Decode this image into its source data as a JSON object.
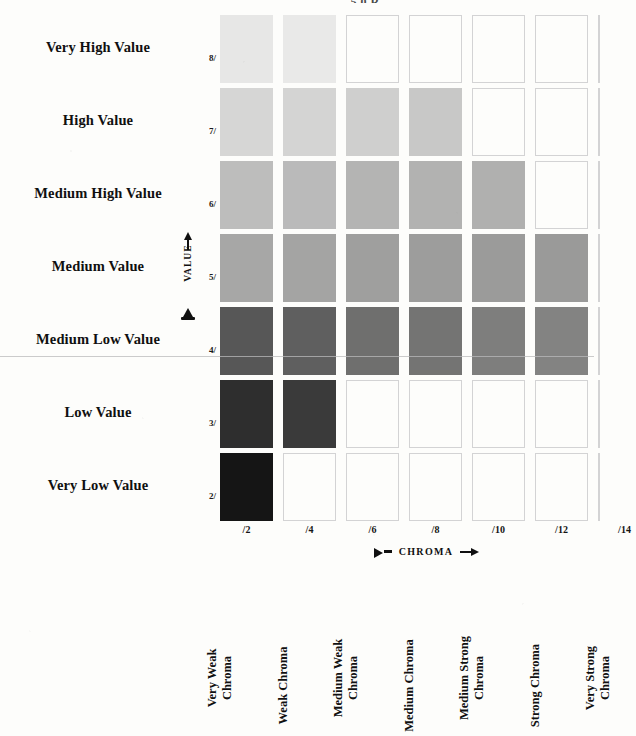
{
  "caption": {
    "top_partial": "5.0 R"
  },
  "axes": {
    "value_axis_label": "VALUE",
    "chroma_axis_label": "CHROMA",
    "value_ticks": [
      "8/",
      "7/",
      "6/",
      "5/",
      "4/",
      "3/",
      "2/"
    ],
    "chroma_ticks": [
      "/2",
      "/4",
      "/6",
      "/8",
      "/10",
      "/12",
      "/14"
    ]
  },
  "rows": [
    {
      "label": "Very High Value",
      "tick": "8/"
    },
    {
      "label": "High Value",
      "tick": "7/"
    },
    {
      "label": "Medium High Value",
      "tick": "6/"
    },
    {
      "label": "Medium Value",
      "tick": "5/"
    },
    {
      "label": "Medium Low Value",
      "tick": "4/"
    },
    {
      "label": "Low Value",
      "tick": "3/"
    },
    {
      "label": "Very Low Value",
      "tick": "2/"
    }
  ],
  "columns": [
    {
      "tick": "/2",
      "name": "Very Weak\nChroma"
    },
    {
      "tick": "/4",
      "name": "Weak Chroma"
    },
    {
      "tick": "/6",
      "name": "Medium Weak\nChroma"
    },
    {
      "tick": "/8",
      "name": "Medium Chroma"
    },
    {
      "tick": "/10",
      "name": "Medium Strong\nChroma"
    },
    {
      "tick": "/12",
      "name": "Strong Chroma"
    },
    {
      "tick": "/14",
      "name": "Very Strong\nChroma"
    }
  ],
  "chart_data": {
    "type": "heatmap",
    "xlabel": "CHROMA",
    "ylabel": "VALUE",
    "x": [
      "/2",
      "/4",
      "/6",
      "/8",
      "/10",
      "/12",
      "/14"
    ],
    "y": [
      "8/",
      "7/",
      "6/",
      "5/",
      "4/",
      "3/",
      "2/"
    ],
    "grid": false,
    "legend": "none",
    "note": "Grayscale reproduction of a Munsell hue page; cells present only where that value/chroma combination exists.",
    "cells": [
      {
        "value": "8/",
        "chroma": "/2",
        "filled": true,
        "color": "#e7e7e6"
      },
      {
        "value": "8/",
        "chroma": "/4",
        "filled": true,
        "color": "#e9e9e8"
      },
      {
        "value": "8/",
        "chroma": "/6",
        "filled": false,
        "color": "#fdfdfb"
      },
      {
        "value": "8/",
        "chroma": "/8",
        "filled": false,
        "color": "#fdfdfb"
      },
      {
        "value": "8/",
        "chroma": "/10",
        "filled": false,
        "color": "#fdfdfb"
      },
      {
        "value": "8/",
        "chroma": "/12",
        "filled": false,
        "color": "#fdfdfb"
      },
      {
        "value": "8/",
        "chroma": "/14",
        "filled": false,
        "color": "#fdfdfb"
      },
      {
        "value": "7/",
        "chroma": "/2",
        "filled": true,
        "color": "#d6d6d5"
      },
      {
        "value": "7/",
        "chroma": "/4",
        "filled": true,
        "color": "#d4d4d3"
      },
      {
        "value": "7/",
        "chroma": "/6",
        "filled": true,
        "color": "#cfcfce"
      },
      {
        "value": "7/",
        "chroma": "/8",
        "filled": true,
        "color": "#c8c8c7"
      },
      {
        "value": "7/",
        "chroma": "/10",
        "filled": false,
        "color": "#fdfdfb"
      },
      {
        "value": "7/",
        "chroma": "/12",
        "filled": false,
        "color": "#fdfdfb"
      },
      {
        "value": "7/",
        "chroma": "/14",
        "filled": false,
        "color": "#fdfdfb"
      },
      {
        "value": "6/",
        "chroma": "/2",
        "filled": true,
        "color": "#bdbdbc"
      },
      {
        "value": "6/",
        "chroma": "/4",
        "filled": true,
        "color": "#bababa"
      },
      {
        "value": "6/",
        "chroma": "/6",
        "filled": true,
        "color": "#b4b4b3"
      },
      {
        "value": "6/",
        "chroma": "/8",
        "filled": true,
        "color": "#b2b2b1"
      },
      {
        "value": "6/",
        "chroma": "/10",
        "filled": true,
        "color": "#b0b0af"
      },
      {
        "value": "6/",
        "chroma": "/12",
        "filled": false,
        "color": "#fdfdfb"
      },
      {
        "value": "6/",
        "chroma": "/14",
        "filled": false,
        "color": "#fdfdfb"
      },
      {
        "value": "5/",
        "chroma": "/2",
        "filled": true,
        "color": "#a7a7a6"
      },
      {
        "value": "5/",
        "chroma": "/4",
        "filled": true,
        "color": "#a4a4a3"
      },
      {
        "value": "5/",
        "chroma": "/6",
        "filled": true,
        "color": "#9f9f9e"
      },
      {
        "value": "5/",
        "chroma": "/8",
        "filled": true,
        "color": "#9d9d9c"
      },
      {
        "value": "5/",
        "chroma": "/10",
        "filled": true,
        "color": "#9b9b9a"
      },
      {
        "value": "5/",
        "chroma": "/12",
        "filled": true,
        "color": "#9a9a99"
      },
      {
        "value": "5/",
        "chroma": "/14",
        "filled": false,
        "color": "#fdfdfb"
      },
      {
        "value": "4/",
        "chroma": "/2",
        "filled": true,
        "color": "#575757"
      },
      {
        "value": "4/",
        "chroma": "/4",
        "filled": true,
        "color": "#5f5f5f"
      },
      {
        "value": "4/",
        "chroma": "/6",
        "filled": true,
        "color": "#6f6f6e"
      },
      {
        "value": "4/",
        "chroma": "/8",
        "filled": true,
        "color": "#747473"
      },
      {
        "value": "4/",
        "chroma": "/10",
        "filled": true,
        "color": "#7e7e7d"
      },
      {
        "value": "4/",
        "chroma": "/12",
        "filled": true,
        "color": "#838382"
      },
      {
        "value": "4/",
        "chroma": "/14",
        "filled": false,
        "color": "#fdfdfb"
      },
      {
        "value": "3/",
        "chroma": "/2",
        "filled": true,
        "color": "#2e2e2e"
      },
      {
        "value": "3/",
        "chroma": "/4",
        "filled": true,
        "color": "#3a3a3a"
      },
      {
        "value": "3/",
        "chroma": "/6",
        "filled": false,
        "color": "#fdfdfb"
      },
      {
        "value": "3/",
        "chroma": "/8",
        "filled": false,
        "color": "#fdfdfb"
      },
      {
        "value": "3/",
        "chroma": "/10",
        "filled": false,
        "color": "#fdfdfb"
      },
      {
        "value": "3/",
        "chroma": "/12",
        "filled": false,
        "color": "#fdfdfb"
      },
      {
        "value": "3/",
        "chroma": "/14",
        "filled": false,
        "color": "#fdfdfb"
      },
      {
        "value": "2/",
        "chroma": "/2",
        "filled": true,
        "color": "#151515"
      },
      {
        "value": "2/",
        "chroma": "/4",
        "filled": false,
        "color": "#fdfdfb"
      },
      {
        "value": "2/",
        "chroma": "/6",
        "filled": false,
        "color": "#fdfdfb"
      },
      {
        "value": "2/",
        "chroma": "/8",
        "filled": false,
        "color": "#fdfdfb"
      },
      {
        "value": "2/",
        "chroma": "/10",
        "filled": false,
        "color": "#fdfdfb"
      },
      {
        "value": "2/",
        "chroma": "/12",
        "filled": false,
        "color": "#fdfdfb"
      },
      {
        "value": "2/",
        "chroma": "/14",
        "filled": false,
        "color": "#fdfdfb"
      }
    ]
  },
  "geometry": {
    "col_x": [
      220,
      283,
      346,
      409,
      472,
      535,
      598
    ],
    "col_left": [
      220,
      283,
      346,
      409,
      472,
      535,
      535
    ],
    "row_top": [
      15,
      88,
      161,
      234,
      307,
      380,
      453
    ],
    "swatch_w": 53,
    "swatch_h": 68
  }
}
